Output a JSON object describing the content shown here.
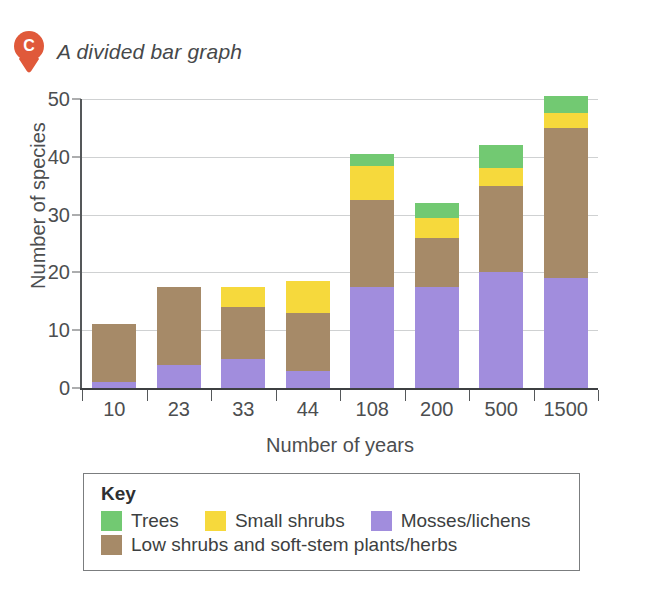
{
  "caption": {
    "marker_letter": "C",
    "marker_color": "#e0593a",
    "text": "A divided bar graph"
  },
  "chart_data": {
    "type": "bar",
    "stacked": true,
    "title": "A divided bar graph",
    "xlabel": "Number of years",
    "ylabel": "Number of species",
    "categories": [
      "10",
      "23",
      "33",
      "44",
      "108",
      "200",
      "500",
      "1500"
    ],
    "ylim": [
      0,
      50
    ],
    "yticks": [
      0,
      10,
      20,
      30,
      40,
      50
    ],
    "grid": "horizontal",
    "legend_position": "below-plot",
    "series": [
      {
        "name": "Mosses/lichens",
        "color": "#a18ddd",
        "values": [
          1,
          4,
          5,
          3,
          17.5,
          17.5,
          20,
          19
        ]
      },
      {
        "name": "Low shrubs and soft-stem plants/herbs",
        "color": "#a68a68",
        "values": [
          10,
          13.5,
          9,
          10,
          15,
          8.5,
          15,
          26
        ]
      },
      {
        "name": "Small shrubs",
        "color": "#f6d93c",
        "values": [
          0,
          0,
          3.5,
          5.5,
          6,
          3.5,
          3,
          2.5
        ]
      },
      {
        "name": "Trees",
        "color": "#72c972",
        "values": [
          0,
          0,
          0,
          0,
          2,
          2.5,
          4,
          3
        ]
      }
    ],
    "totals": [
      11,
      17.5,
      17.5,
      18.5,
      40.5,
      32,
      42,
      50.5
    ]
  },
  "legend": {
    "title": "Key",
    "row1": [
      {
        "label": "Trees",
        "color": "#72c972"
      },
      {
        "label": "Small shrubs",
        "color": "#f6d93c"
      },
      {
        "label": "Mosses/lichens",
        "color": "#a18ddd"
      }
    ],
    "row2": [
      {
        "label": "Low shrubs and soft-stem plants/herbs",
        "color": "#a68a68"
      }
    ]
  }
}
